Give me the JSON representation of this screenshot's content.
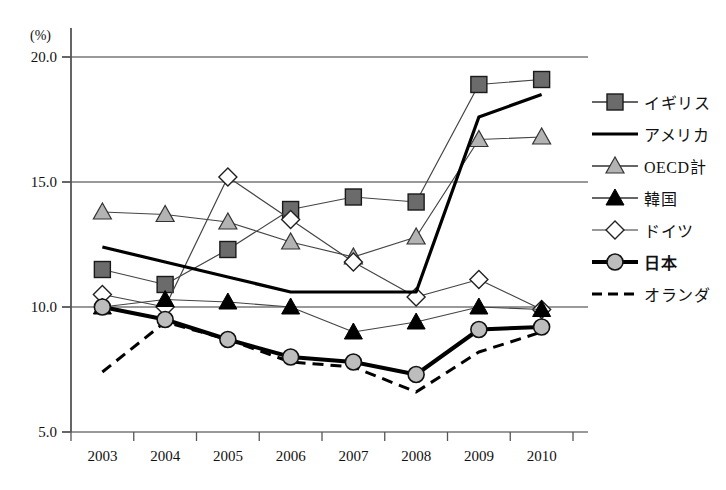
{
  "chart_data": {
    "type": "line",
    "title": "",
    "xlabel": "",
    "ylabel": "(%)",
    "unit_label": "(%)",
    "categories": [
      "2003",
      "2004",
      "2005",
      "2006",
      "2007",
      "2008",
      "2009",
      "2010"
    ],
    "ylim": [
      5.0,
      20.0
    ],
    "yticks": [
      "5.0",
      "10.0",
      "15.0",
      "20.0"
    ],
    "ytick_values": [
      5.0,
      10.0,
      15.0,
      20.0
    ],
    "grid": true,
    "legend_position": "right",
    "series": [
      {
        "name": "イギリス",
        "marker": "square-filled",
        "color": "#6b6b6b",
        "line": "solid-thin",
        "values": [
          11.5,
          10.9,
          12.3,
          13.9,
          14.4,
          14.2,
          18.9,
          19.1
        ]
      },
      {
        "name": "アメリカ",
        "marker": "none",
        "color": "#000000",
        "line": "solid-thick",
        "values": [
          12.4,
          11.8,
          11.2,
          10.6,
          10.6,
          10.6,
          17.6,
          18.5
        ]
      },
      {
        "name": "OECD計",
        "marker": "triangle-gray",
        "color": "#b3b3b3",
        "line": "solid-thin",
        "values": [
          13.8,
          13.7,
          13.4,
          12.6,
          12.0,
          12.8,
          16.7,
          16.8
        ]
      },
      {
        "name": "韓国",
        "marker": "triangle-black",
        "color": "#000000",
        "line": "solid-thin",
        "values": [
          10.0,
          10.3,
          10.2,
          10.0,
          9.0,
          9.4,
          10.0,
          9.9
        ]
      },
      {
        "name": "ドイツ",
        "marker": "diamond-white",
        "color": "#ffffff",
        "line": "solid-thin",
        "values": [
          10.5,
          10.0,
          15.2,
          13.5,
          11.8,
          10.4,
          11.1,
          9.9
        ]
      },
      {
        "name": "日本",
        "marker": "circle-gray",
        "color": "#bdbdbd",
        "line": "solid-bold",
        "bold_label": true,
        "values": [
          10.0,
          9.5,
          8.7,
          8.0,
          7.8,
          7.3,
          9.1,
          9.2
        ]
      },
      {
        "name": "オランダ",
        "marker": "none",
        "color": "#000000",
        "line": "dashed",
        "values": [
          7.4,
          9.4,
          8.7,
          7.8,
          7.6,
          6.6,
          8.2,
          9.0
        ]
      }
    ]
  },
  "legend": {
    "items": [
      {
        "label": "イギリス",
        "key": "square-filled-key"
      },
      {
        "label": "アメリカ",
        "key": "thick-line-key"
      },
      {
        "label": "OECD計",
        "key": "triangle-gray-key"
      },
      {
        "label": "韓国",
        "key": "triangle-black-key"
      },
      {
        "label": "ドイツ",
        "key": "diamond-white-key"
      },
      {
        "label": "日本",
        "key": "circle-gray-bold-key"
      },
      {
        "label": "オランダ",
        "key": "dashed-line-key"
      }
    ]
  },
  "colors": {
    "axis": "#555555",
    "grid": "#777777",
    "uk_fill": "#6b6b6b",
    "oecd_fill": "#b3b3b3",
    "japan_fill": "#bdbdbd",
    "korea_fill": "#000000",
    "germany_fill": "#ffffff"
  }
}
